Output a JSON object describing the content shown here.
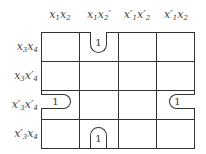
{
  "kmap": {
    "columns": [
      {
        "var1": "x",
        "sub1": "1",
        "prime1": "",
        "var2": "x",
        "sub2": "2",
        "prime2": ""
      },
      {
        "var1": "x",
        "sub1": "1",
        "prime1": "",
        "var2": "x",
        "sub2": "2",
        "prime2": "′"
      },
      {
        "var1": "x",
        "sub1": "1",
        "prime1": "′",
        "var2": "x",
        "sub2": "2",
        "prime2": "′"
      },
      {
        "var1": "x",
        "sub1": "1",
        "prime1": "′",
        "var2": "x",
        "sub2": "2",
        "prime2": ""
      }
    ],
    "rows": [
      {
        "var1": "x",
        "sub1": "3",
        "prime1": "",
        "var2": "x",
        "sub2": "4",
        "prime2": ""
      },
      {
        "var1": "x",
        "sub1": "3",
        "prime1": "",
        "var2": "x",
        "sub2": "4",
        "prime2": "′"
      },
      {
        "var1": "x",
        "sub1": "3",
        "prime1": "′",
        "var2": "x",
        "sub2": "4",
        "prime2": "′"
      },
      {
        "var1": "x",
        "sub1": "3",
        "prime1": "′",
        "var2": "x",
        "sub2": "4",
        "prime2": ""
      }
    ],
    "cells": [
      {
        "row": 0,
        "col": 1,
        "value": "1",
        "loop": "open-top"
      },
      {
        "row": 2,
        "col": 0,
        "value": "1",
        "loop": "open-left"
      },
      {
        "row": 2,
        "col": 3,
        "value": "1",
        "loop": "open-right"
      },
      {
        "row": 3,
        "col": 1,
        "value": "1",
        "loop": "open-bottom"
      }
    ]
  }
}
